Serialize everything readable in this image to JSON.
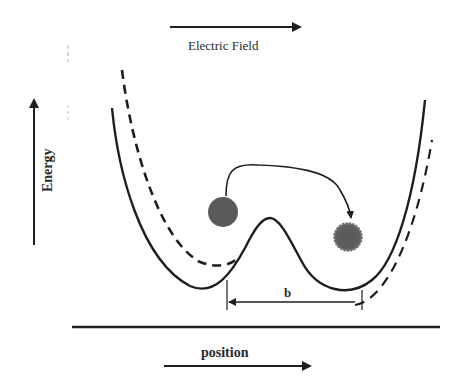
{
  "diagram": {
    "title_arrow_label": "Electric Field",
    "y_axis_label": "Energy",
    "x_axis_label": "position",
    "distance_label": "b",
    "colors": {
      "ink": "#1e1e1e",
      "particle": "#5a5a5a",
      "background": "#ffffff"
    },
    "curves": [
      {
        "name": "potential-without-field",
        "style": "solid"
      },
      {
        "name": "potential-with-field",
        "style": "dashed"
      }
    ],
    "particles": [
      {
        "name": "initial-particle",
        "state": "solid"
      },
      {
        "name": "final-particle",
        "state": "fuzzy"
      }
    ]
  }
}
